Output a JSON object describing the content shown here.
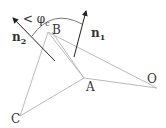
{
  "diagram": {
    "points": {
      "B": {
        "label": "B",
        "x": 48,
        "y": 32
      },
      "A": {
        "label": "A",
        "x": 84,
        "y": 78
      },
      "O": {
        "label": "O",
        "x": 157,
        "y": 88
      },
      "C": {
        "label": "C",
        "x": 20,
        "y": 116
      }
    },
    "vectors": {
      "n1": {
        "label": "n",
        "sub": "1"
      },
      "n2": {
        "label": "n",
        "sub": "2"
      }
    },
    "angle": {
      "label": "< φ",
      "sub": "c"
    },
    "colors": {
      "edges": "#bbbbbb",
      "arrows": "#333333"
    }
  }
}
